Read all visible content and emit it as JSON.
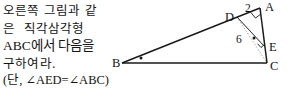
{
  "problem": {
    "lines": [
      {
        "id": "line1",
        "text": "오른쪽 그림과 같",
        "style": "korean"
      },
      {
        "id": "line2",
        "text": "은  직각삼각형",
        "style": "korean"
      },
      {
        "id": "line3",
        "text": "ABC에서 다음을",
        "style": "mixed"
      },
      {
        "id": "line4",
        "text": "구하여라.",
        "style": "korean"
      }
    ],
    "condition": "(단, ∠AED=∠ABC)"
  },
  "figure": {
    "caption": "right triangle ABC with point D on AB and point E on AC",
    "vertices": [
      {
        "name": "A",
        "label": "A",
        "x": 152,
        "y": 8,
        "label_x": 157,
        "label_y": 11
      },
      {
        "name": "B",
        "label": "B",
        "x": 14,
        "y": 63,
        "label_x": 5,
        "label_y": 67
      },
      {
        "name": "C",
        "label": "C",
        "x": 159,
        "y": 63,
        "label_x": 162,
        "label_y": 70
      },
      {
        "name": "D",
        "label": "D",
        "x": 129,
        "y": 17,
        "label_x": 118,
        "label_y": 21
      },
      {
        "name": "E",
        "label": "E",
        "x": 156,
        "y": 46,
        "label_x": 161,
        "label_y": 51
      }
    ],
    "segment_labels": [
      {
        "name": "segment-DA-length",
        "text": "2",
        "x": 139,
        "y": 12
      },
      {
        "name": "segment-DE-length",
        "text": "6",
        "x": 131,
        "y": 42
      }
    ],
    "angle_marks": [
      {
        "name": "angle-B-dot",
        "x": 33,
        "y": 58
      },
      {
        "name": "angle-AEC-dot",
        "x": 146,
        "y": 38
      }
    ],
    "right_angles": [
      {
        "name": "right-angle-at-A",
        "at": "A"
      },
      {
        "name": "right-angle-at-E",
        "at": "E"
      }
    ],
    "colors": {
      "stroke": "#1a1a1a",
      "dashed": "#8d8d8d",
      "text": "#151515",
      "background": "#ffffff"
    }
  }
}
